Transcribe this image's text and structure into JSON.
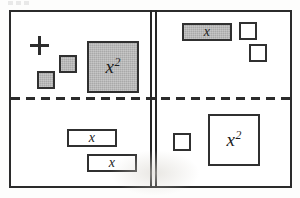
{
  "diagram": {
    "type": "four-quadrant-algebra-tile-mat",
    "colors": {
      "ink": "#2b2b2b",
      "shaded_tile_fill": "#a9a9a9",
      "blank_tile_fill": "#ffffff",
      "background": "#ffffff"
    },
    "dividers": {
      "vertical": {
        "style": "double-solid",
        "name": "vertical-double-line"
      },
      "horizontal": {
        "style": "dashed",
        "name": "horizontal-dashed-line"
      }
    },
    "signs": [
      {
        "name": "plus-top-left",
        "glyph": "+",
        "quadrant": "top-left"
      },
      {
        "name": "plus-top-right",
        "glyph": "+",
        "quadrant": "top-right"
      },
      {
        "name": "minus-bottom-left",
        "glyph": "−",
        "quadrant": "bottom-left"
      },
      {
        "name": "minus-bottom-right",
        "glyph": "−",
        "quadrant": "bottom-right"
      }
    ],
    "quadrants": [
      {
        "name": "top-left",
        "sign": "+",
        "tiles": [
          {
            "name": "unit-tile",
            "label": "",
            "exponent": "",
            "fill": "shaded",
            "size": "unit"
          },
          {
            "name": "unit-tile",
            "label": "",
            "exponent": "",
            "fill": "shaded",
            "size": "unit"
          },
          {
            "name": "x-squared-tile",
            "label": "x",
            "exponent": "2",
            "fill": "shaded",
            "size": "x2"
          }
        ]
      },
      {
        "name": "top-right",
        "sign": "+",
        "tiles": [
          {
            "name": "x-tile",
            "label": "x",
            "exponent": "",
            "fill": "shaded",
            "size": "x-rect"
          },
          {
            "name": "unit-tile",
            "label": "",
            "exponent": "",
            "fill": "blank",
            "size": "unit"
          },
          {
            "name": "unit-tile",
            "label": "",
            "exponent": "",
            "fill": "blank",
            "size": "unit"
          }
        ]
      },
      {
        "name": "bottom-left",
        "sign": "−",
        "tiles": [
          {
            "name": "x-tile",
            "label": "x",
            "exponent": "",
            "fill": "blank",
            "size": "x-rect"
          },
          {
            "name": "x-tile",
            "label": "x",
            "exponent": "",
            "fill": "blank",
            "size": "x-rect"
          }
        ]
      },
      {
        "name": "bottom-right",
        "sign": "−",
        "tiles": [
          {
            "name": "unit-tile",
            "label": "",
            "exponent": "",
            "fill": "blank",
            "size": "unit"
          },
          {
            "name": "x-squared-tile",
            "label": "x",
            "exponent": "2",
            "fill": "blank",
            "size": "x2"
          }
        ]
      }
    ],
    "labels": {
      "x": "x",
      "x_squared_base": "x",
      "x_squared_exponent": "2",
      "plus": "+",
      "minus": "−"
    }
  }
}
